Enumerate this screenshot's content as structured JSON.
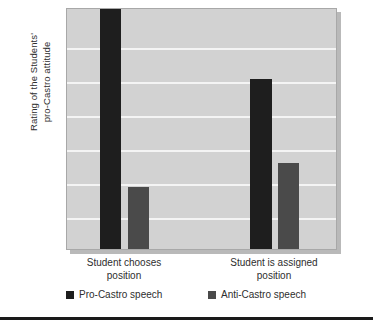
{
  "chart_data": {
    "type": "bar",
    "title": "",
    "subtitle": "",
    "xlabel": "",
    "ylabel": "Rating of the Students'\npro-Castro attitude",
    "categories": [
      "Student chooses\nposition",
      "Student is assigned\nposition"
    ],
    "category_labels_flat": [
      "Student chooses position",
      "Student is assigned position"
    ],
    "series": [
      {
        "name": "Pro-Castro speech",
        "color": "#1e1e1e",
        "values": [
          100,
          71
        ]
      },
      {
        "name": "Anti-Castro speech",
        "color": "#4a4a4a",
        "values": [
          26,
          36
        ]
      }
    ],
    "ylim": [
      0,
      100
    ],
    "y_tick_labels": [],
    "gridlines": 6,
    "grid": true,
    "grid_color": "#f4f4f4",
    "legend_position": "bottom",
    "plot_background": "#d2d2d2"
  },
  "legend": {
    "items": [
      {
        "label": "Pro-Castro speech",
        "series": "pro"
      },
      {
        "label": "Anti-Castro speech",
        "series": "anti"
      }
    ]
  },
  "colors": {
    "pro_castro": "#1e1e1e",
    "anti_castro": "#4a4a4a",
    "plot_bg": "#d2d2d2",
    "gridline": "#f4f4f4",
    "rule": "#1a1a1a"
  }
}
